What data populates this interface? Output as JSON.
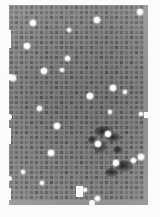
{
  "image": {
    "kind": "grayscale-micrograph",
    "title": "Grid Array Micrograph",
    "width_px": 160,
    "height_px": 217,
    "background_color": "#fbfbfa",
    "specimen": {
      "x": 9,
      "y": 5,
      "width": 139,
      "height": 200,
      "base_color": "#8f8f8f",
      "cell_color": "#5e5e5e"
    },
    "grid": {
      "pitch_px": 5.0,
      "cell_px": 3.1,
      "columns": 27,
      "rows": 39
    }
  },
  "defects": {
    "bright_particles": [
      {
        "x": 140,
        "y": 12,
        "d": 6.0
      },
      {
        "x": 33,
        "y": 23,
        "d": 6.2
      },
      {
        "x": 97,
        "y": 20,
        "d": 5.4
      },
      {
        "x": 69,
        "y": 30,
        "d": 4.4
      },
      {
        "x": 27,
        "y": 46,
        "d": 5.6
      },
      {
        "x": 67,
        "y": 58,
        "d": 5.0
      },
      {
        "x": 44,
        "y": 71,
        "d": 5.6
      },
      {
        "x": 62,
        "y": 70,
        "d": 4.6
      },
      {
        "x": 13,
        "y": 78,
        "d": 5.2
      },
      {
        "x": 113,
        "y": 88,
        "d": 5.6
      },
      {
        "x": 125,
        "y": 92,
        "d": 4.8
      },
      {
        "x": 90,
        "y": 96,
        "d": 5.2
      },
      {
        "x": 39,
        "y": 108,
        "d": 5.0
      },
      {
        "x": 110,
        "y": 112,
        "d": 4.6
      },
      {
        "x": 141,
        "y": 114,
        "d": 4.4
      },
      {
        "x": 57,
        "y": 126,
        "d": 5.6
      },
      {
        "x": 108,
        "y": 134,
        "d": 5.8
      },
      {
        "x": 98,
        "y": 144,
        "d": 5.6
      },
      {
        "x": 51,
        "y": 153,
        "d": 5.6
      },
      {
        "x": 141,
        "y": 157,
        "d": 5.4
      },
      {
        "x": 116,
        "y": 163,
        "d": 5.8
      },
      {
        "x": 133,
        "y": 160,
        "d": 5.0
      },
      {
        "x": 23,
        "y": 172,
        "d": 4.8
      },
      {
        "x": 42,
        "y": 183,
        "d": 4.4
      },
      {
        "x": 85,
        "y": 190,
        "d": 4.6
      },
      {
        "x": 97,
        "y": 198,
        "d": 5.0
      }
    ],
    "dark_smudges": [
      {
        "x": 104,
        "y": 131,
        "w": 20,
        "h": 11
      },
      {
        "x": 113,
        "y": 137,
        "w": 15,
        "h": 9
      },
      {
        "x": 100,
        "y": 146,
        "w": 14,
        "h": 13
      },
      {
        "x": 118,
        "y": 150,
        "w": 10,
        "h": 8
      },
      {
        "x": 124,
        "y": 166,
        "w": 18,
        "h": 12
      },
      {
        "x": 112,
        "y": 172,
        "w": 14,
        "h": 9
      },
      {
        "x": 92,
        "y": 140,
        "w": 9,
        "h": 8
      }
    ],
    "edge_notches": [
      {
        "x": 6,
        "y": 74,
        "w": 7,
        "h": 6,
        "shape": "round"
      },
      {
        "x": 6,
        "y": 114,
        "w": 6,
        "h": 6,
        "shape": "round"
      },
      {
        "x": 6,
        "y": 176,
        "w": 6,
        "h": 5,
        "shape": "round"
      },
      {
        "x": 6,
        "y": 30,
        "w": 5,
        "h": 18,
        "shape": "rect"
      },
      {
        "x": 6,
        "y": 128,
        "w": 5,
        "h": 16,
        "shape": "rect"
      },
      {
        "x": 6,
        "y": 188,
        "w": 5,
        "h": 12,
        "shape": "rect"
      },
      {
        "x": 144,
        "y": 112,
        "w": 5,
        "h": 6,
        "shape": "rect"
      },
      {
        "x": 76,
        "y": 186,
        "w": 7,
        "h": 11,
        "shape": "rect"
      },
      {
        "x": 89,
        "y": 200,
        "w": 6,
        "h": 6,
        "shape": "round"
      }
    ],
    "streaks": [
      {
        "x": 76,
        "y": 48,
        "w": 1,
        "h": 14
      },
      {
        "x": 62,
        "y": 104,
        "w": 1,
        "h": 9
      },
      {
        "x": 120,
        "y": 60,
        "w": 1,
        "h": 7
      }
    ]
  }
}
